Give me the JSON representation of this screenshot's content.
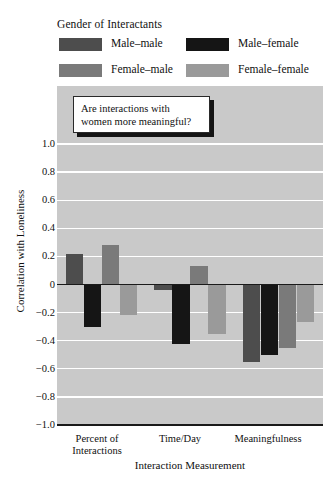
{
  "legend": {
    "title": "Gender of Interactants",
    "entries": [
      {
        "label": "Male–male",
        "color": "#4d4d4d"
      },
      {
        "label": "Male–female",
        "color": "#151515"
      },
      {
        "label": "Female–male",
        "color": "#7a7a7a"
      },
      {
        "label": "Female–female",
        "color": "#9a9a9a"
      }
    ]
  },
  "annotation": {
    "text": "Are interactions with\nwomen more meaningful?"
  },
  "axes": {
    "ylabel": "Correlation with Loneliness",
    "xlabel": "Interaction Measurement",
    "yticks": [
      "1.0",
      "0.8",
      "0.6",
      "0.4",
      "0.2",
      "0",
      "−0.2",
      "−0.4",
      "−0.6",
      "−0.8",
      "−1.0"
    ],
    "ytick_values": [
      1.0,
      0.8,
      0.6,
      0.4,
      0.2,
      0,
      -0.2,
      -0.4,
      -0.6,
      -0.8,
      -1.0
    ],
    "xticks": [
      "Percent of\nInteractions",
      "Time/Day",
      "Meaningfulness"
    ]
  },
  "chart_data": {
    "type": "bar",
    "title": "",
    "subtitle": "",
    "xlabel": "Interaction Measurement",
    "ylabel": "Correlation with Loneliness",
    "categories": [
      "Percent of Interactions",
      "Time/Day",
      "Meaningfulness"
    ],
    "ylim": [
      -1.0,
      1.0
    ],
    "ytick_step": 0.2,
    "grid": true,
    "grid_color": "#ffffff",
    "plot_background": "#c9c9c9",
    "legend_position": "above-plot",
    "legend_title": "Gender of Interactants",
    "zero_line": true,
    "annotations": [
      {
        "text": "Are interactions with women more meaningful?",
        "target": "Meaningfulness"
      }
    ],
    "series": [
      {
        "name": "Male–male",
        "color": "#4d4d4d",
        "values": [
          0.22,
          -0.04,
          -0.55
        ]
      },
      {
        "name": "Male–female",
        "color": "#151515",
        "values": [
          -0.3,
          -0.42,
          -0.5
        ]
      },
      {
        "name": "Female–male",
        "color": "#7a7a7a",
        "values": [
          0.28,
          0.13,
          -0.45
        ]
      },
      {
        "name": "Female–female",
        "color": "#9a9a9a",
        "values": [
          -0.22,
          -0.35,
          -0.27
        ]
      }
    ],
    "series_draw_order": [
      "Male–male",
      "Male–female",
      "Female–male",
      "Female–female"
    ]
  }
}
